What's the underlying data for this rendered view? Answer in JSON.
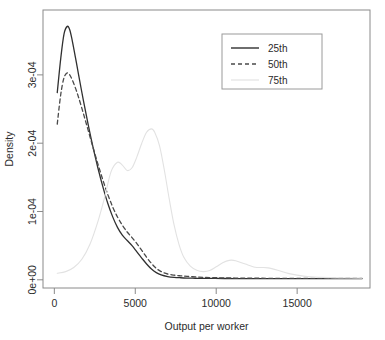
{
  "chart_data": {
    "type": "line",
    "title": "",
    "xlabel": "Output per worker",
    "ylabel": "Density",
    "xlim": [
      -700,
      19500
    ],
    "ylim": [
      -1.2e-05,
      0.000395
    ],
    "grid": false,
    "legend_position": "top-right",
    "xticks": [
      0,
      5000,
      10000,
      15000
    ],
    "xticklabels": [
      "0",
      "5000",
      "10000",
      "15000"
    ],
    "yticks": [
      0.0,
      0.0001,
      0.0002,
      0.0003
    ],
    "yticklabels": [
      "0e+00",
      "1e-04",
      "2e-04",
      "3e-04"
    ],
    "legend": [
      {
        "label": "25th",
        "style": "solid",
        "color": "#303030"
      },
      {
        "label": "50th",
        "style": "dashed",
        "color": "#4a4a4a"
      },
      {
        "label": "75th",
        "style": "solid-faint",
        "color": "#e0e0e0"
      }
    ],
    "series": [
      {
        "name": "25th",
        "style": "solid",
        "color": "#303030",
        "x": [
          180,
          400,
          600,
          800,
          950,
          1100,
          1300,
          1500,
          1800,
          2100,
          2400,
          2700,
          3000,
          3300,
          3600,
          3900,
          4200,
          4500,
          4800,
          5100,
          5400,
          5700,
          6000,
          6300,
          6600,
          7000,
          7400,
          7800,
          8200,
          8700,
          9200,
          9800,
          10500,
          11500,
          12500,
          13500,
          15000,
          16500,
          18000,
          19000
        ],
        "y": [
          0.000274,
          0.000325,
          0.00036,
          0.000371,
          0.000366,
          0.000351,
          0.000326,
          0.0003,
          0.000262,
          0.000226,
          0.000193,
          0.000163,
          0.000136,
          0.000112,
          9.25e-05,
          7.68e-05,
          6.55e-05,
          5.75e-05,
          5e-05,
          4.08e-05,
          3.18e-05,
          2.32e-05,
          1.58e-05,
          1.05e-05,
          7.2e-06,
          4.8e-06,
          3.6e-06,
          3e-06,
          2.6e-06,
          2.3e-06,
          2.1e-06,
          2e-06,
          1.9e-06,
          1.8e-06,
          1.7e-06,
          1.7e-06,
          1.6e-06,
          1.6e-06,
          1.6e-06,
          1.6e-06
        ]
      },
      {
        "name": "50th",
        "style": "dashed",
        "color": "#4a4a4a",
        "x": [
          180,
          400,
          600,
          800,
          950,
          1100,
          1300,
          1500,
          1800,
          2100,
          2400,
          2700,
          3000,
          3300,
          3600,
          3900,
          4200,
          4500,
          4800,
          5100,
          5400,
          5700,
          6000,
          6300,
          6600,
          7000,
          7400,
          7800,
          8200,
          8700,
          9200,
          9800,
          10500,
          11500,
          12500,
          13500,
          15000,
          16500,
          18000,
          19000
        ],
        "y": [
          0.000228,
          0.000272,
          0.000296,
          0.000303,
          0.0003,
          0.000293,
          0.000281,
          0.000267,
          0.000243,
          0.000218,
          0.000193,
          0.000169,
          0.000146,
          0.000125,
          0.000107,
          9.2e-05,
          8e-05,
          7e-05,
          6.18e-05,
          5.3e-05,
          4.32e-05,
          3.3e-05,
          2.4e-05,
          1.68e-05,
          1.2e-05,
          8.5e-06,
          6.8e-06,
          5.8e-06,
          5e-06,
          4.2e-06,
          3.6e-06,
          3.1e-06,
          2.8e-06,
          2.5e-06,
          2.3e-06,
          2.2e-06,
          2.1e-06,
          2e-06,
          2e-06,
          2e-06
        ]
      },
      {
        "name": "75th",
        "style": "solid-faint",
        "color": "#e2e2e2",
        "x": [
          180,
          700,
          1200,
          1700,
          2200,
          2700,
          3100,
          3500,
          3900,
          4200,
          4500,
          4800,
          5100,
          5400,
          5700,
          6000,
          6200,
          6500,
          6800,
          7100,
          7400,
          7700,
          8000,
          8400,
          8800,
          9200,
          9600,
          10000,
          10400,
          10800,
          11200,
          11800,
          12400,
          12800,
          13200,
          13800,
          14500,
          15500,
          16500,
          17500,
          19000
        ],
        "y": [
          9.5e-06,
          1.2e-05,
          1.8e-05,
          3e-05,
          5.2e-05,
          8.6e-05,
          0.00012,
          0.000158,
          0.000172,
          0.000168,
          0.00016,
          0.000164,
          0.00018,
          0.0002,
          0.000216,
          0.000221,
          0.000216,
          0.000196,
          0.00016,
          0.000118,
          8e-05,
          5.2e-05,
          3.3e-05,
          2e-05,
          1.4e-05,
          1.2e-05,
          1.35e-05,
          1.9e-05,
          2.5e-05,
          2.85e-05,
          2.8e-05,
          2.3e-05,
          1.85e-05,
          1.8e-05,
          1.75e-05,
          1.4e-05,
          9e-06,
          5e-06,
          3.5e-06,
          2.8e-06,
          2.5e-06
        ]
      }
    ]
  }
}
